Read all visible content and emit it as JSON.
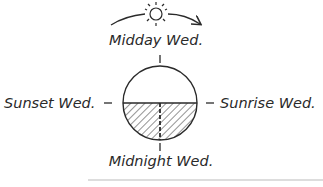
{
  "diagram": {
    "labels": {
      "top": "Midday Wed.",
      "left": "Sunset Wed.",
      "right": "Sunrise Wed.",
      "bottom": "Midnight Wed."
    },
    "icons": {
      "sun": "sun-icon",
      "arrow": "curved-arrow-icon"
    },
    "colors": {
      "ink": "#2a2a2a",
      "divider": "#bbbbbb"
    }
  }
}
